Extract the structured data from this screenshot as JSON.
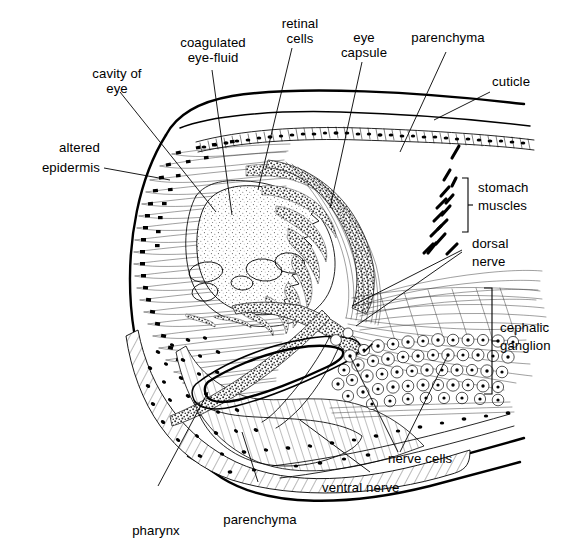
{
  "figure": {
    "kind": "anatomical-section-diagram",
    "background_color": "#ffffff",
    "ink_color": "#000000"
  },
  "labels": {
    "cavity_of_eye": "cavity of\neye",
    "cavity_of_eye_line1": "cavity of",
    "cavity_of_eye_line2": "eye",
    "coagulated_eye_fluid_line1": "coagulated",
    "coagulated_eye_fluid_line2": "eye-fluid",
    "retinal_cells_line1": "retinal",
    "retinal_cells_line2": "cells",
    "eye_capsule_line1": "eye",
    "eye_capsule_line2": "capsule",
    "parenchyma_top": "parenchyma",
    "cuticle": "cuticle",
    "altered_epidermis_line1": "altered",
    "altered_epidermis_line2": "epidermis",
    "stomach_muscles_line1": "stomach",
    "stomach_muscles_line2": "muscles",
    "dorsal_nerve_line1": "dorsal",
    "dorsal_nerve_line2": "nerve",
    "cephalic_ganglion_line1": "cephalic",
    "cephalic_ganglion_line2": "ganglion",
    "nerve_cells": "nerve cells",
    "ventral_nerve": "ventral nerve",
    "parenchyma_bottom": "parenchyma",
    "pharynx": "pharynx"
  },
  "structures": [
    {
      "id": "cuticle",
      "name": "cuticle",
      "description": "thin outer boundary line along dorsal surface"
    },
    {
      "id": "altered-epidermis",
      "name": "altered epidermis",
      "description": "radiating elongated epidermal cells with dark nuclei along anterior left margin"
    },
    {
      "id": "eye-cavity",
      "name": "cavity of eye",
      "description": "large pale chamber in centre of head"
    },
    {
      "id": "coagulated-eye-fluid",
      "name": "coagulated eye-fluid",
      "description": "stippled granular mass filling the eye cavity"
    },
    {
      "id": "retinal-cells",
      "name": "retinal cells",
      "description": "chains of dark granular cells lining the posterior wall of the eye"
    },
    {
      "id": "eye-capsule",
      "name": "eye capsule",
      "description": "dark stippled band enclosing the eye posteriorly"
    },
    {
      "id": "parenchyma",
      "name": "parenchyma",
      "description": "hatched tissue with scattered nuclei filling body spaces"
    },
    {
      "id": "stomach-muscles",
      "name": "stomach muscles",
      "description": "short dark obliquely cut muscle fibres at right"
    },
    {
      "id": "dorsal-nerve",
      "name": "dorsal nerve",
      "description": "nerve trunk running dorsally from the ganglion"
    },
    {
      "id": "cephalic-ganglion",
      "name": "cephalic ganglion",
      "description": "mass of rounded nerve cells and fibre tracts at right"
    },
    {
      "id": "nerve-cells",
      "name": "nerve cells",
      "description": "rounded ganglion cells with nuclei"
    },
    {
      "id": "ventral-nerve",
      "name": "ventral nerve",
      "description": "nerve trunk running ventrally from the ganglion"
    },
    {
      "id": "pharynx",
      "name": "pharynx",
      "description": "elongate lens-shaped lumen in lower centre"
    }
  ]
}
